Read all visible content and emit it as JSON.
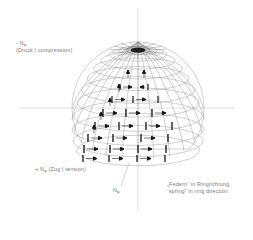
{
  "diagram": {
    "labels": {
      "compression": {
        "line1": "- N",
        "sub1": "φ",
        "line2": "(Druck | compression)"
      },
      "tension": {
        "line1": "+ N",
        "sub1": "φ",
        "line1b": " (Zug | tension)"
      },
      "meridian_force": {
        "line1": "N",
        "sub1": "φ"
      },
      "spring": {
        "line1": "„Federn“ in Ringrichtung",
        "line2": "“spring” in ring direction"
      }
    },
    "geometry": {
      "center_x": 138,
      "center_y": 108,
      "radius": 66,
      "meridian_count": 24,
      "parallel_count": 11,
      "pole_x": 138,
      "pole_y": 50
    },
    "colors": {
      "grid": "#8a8a8a",
      "axis": "#b9b9b9",
      "arrow": "#151515",
      "text": "#7a7a7a",
      "background": "#ffffff"
    },
    "axes": {
      "horizontal_y": 108,
      "vertical_x": 138
    }
  }
}
